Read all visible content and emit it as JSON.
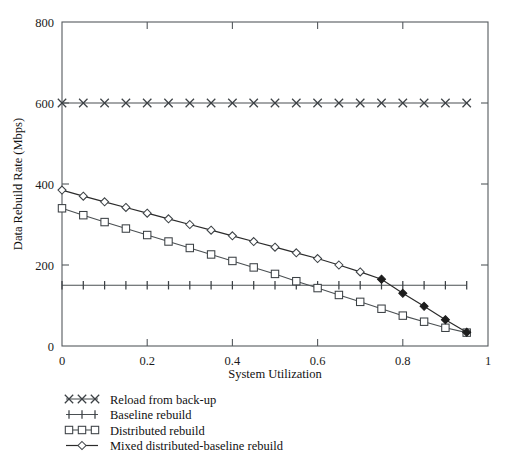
{
  "figure": {
    "background": "#ffffff",
    "ink": "#1a1a1a"
  },
  "chart_data": {
    "type": "line",
    "title": "",
    "xlabel": "System Utilization",
    "ylabel": "Data Rebuild Rate (Mbps)",
    "xlim": [
      0,
      1
    ],
    "ylim": [
      0,
      800
    ],
    "xticks": [
      0,
      0.2,
      0.4,
      0.6,
      0.8,
      1
    ],
    "xticklabels": [
      "0",
      "0.2",
      "0.4",
      "0.6",
      "0.8",
      "1"
    ],
    "yticks": [
      0,
      200,
      400,
      600,
      800
    ],
    "yticklabels": [
      "0",
      "200",
      "400",
      "600",
      "800"
    ],
    "minor_xtick_step": 0.05,
    "grid": false,
    "legend_position": "below-axes-left",
    "x": [
      0,
      0.05,
      0.1,
      0.15,
      0.2,
      0.25,
      0.3,
      0.35,
      0.4,
      0.45,
      0.5,
      0.55,
      0.6,
      0.65,
      0.7,
      0.75,
      0.8,
      0.85,
      0.9,
      0.95
    ],
    "series": [
      {
        "name": "Reload from back-up",
        "marker": "x",
        "marker_style": "cross",
        "values": [
          600,
          600,
          600,
          600,
          600,
          600,
          600,
          600,
          600,
          600,
          600,
          600,
          600,
          600,
          600,
          600,
          600,
          600,
          600,
          600
        ]
      },
      {
        "name": "Baseline rebuild",
        "marker": "+",
        "marker_style": "plus",
        "values": [
          150,
          150,
          150,
          150,
          150,
          150,
          150,
          150,
          150,
          150,
          150,
          150,
          150,
          150,
          150,
          150,
          150,
          150,
          150,
          150
        ]
      },
      {
        "name": "Distributed rebuild",
        "marker": "square",
        "marker_style": "open-square",
        "values": [
          340,
          323,
          306,
          290,
          274,
          258,
          242,
          226,
          210,
          194,
          178,
          160,
          143,
          126,
          109,
          92,
          75,
          60,
          45,
          33
        ]
      },
      {
        "name": "Mixed distributed-baseline rebuild",
        "marker": "diamond",
        "marker_style": "open-diamond",
        "values": [
          385,
          370,
          356,
          342,
          328,
          314,
          300,
          286,
          272,
          258,
          244,
          230,
          216,
          200,
          183,
          165,
          130,
          98,
          65,
          34
        ]
      }
    ],
    "legend": [
      {
        "label": "Reload from back-up",
        "marker": "x"
      },
      {
        "label": "Baseline rebuild",
        "marker": "+"
      },
      {
        "label": "Distributed rebuild",
        "marker": "square"
      },
      {
        "label": "Mixed distributed-baseline rebuild",
        "marker": "diamond"
      }
    ]
  }
}
